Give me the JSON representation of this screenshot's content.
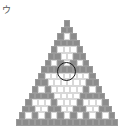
{
  "figure": {
    "label": "ウ",
    "rows": 16,
    "colors": {
      "odd": "#8c8c8c",
      "even": "#ffffff",
      "marker": "#1a1a1a"
    },
    "layout": {
      "apex_x": 67,
      "top_y": 20,
      "brick_w": 6.4,
      "brick_h": 6.6
    },
    "marker": {
      "shape": "circle",
      "cx": 66.5,
      "cy": 71.5,
      "r": 9.5
    }
  }
}
